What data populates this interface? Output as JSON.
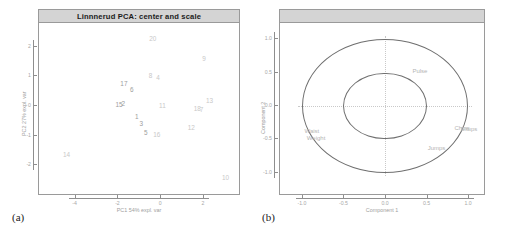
{
  "figure": {
    "panel_a_caption": "(a)",
    "panel_b_caption": "(b)"
  },
  "panel_a": {
    "title": "Linnnerud PCA: center and scale",
    "xlabel": "PC1 54% expl. var",
    "ylabel": "PC2 27% expl. var",
    "xticks": [
      "-4",
      "-2",
      "0",
      "2"
    ],
    "yticks": [
      "2",
      "1",
      "0",
      "-1",
      "-2"
    ]
  },
  "panel_b": {
    "xlabel": "Component 1",
    "ylabel": "Component 2",
    "xticks": [
      "-1.0",
      "-0.5",
      "0.0",
      "0.5",
      "1.0"
    ],
    "yticks": [
      "1.0",
      "0.5",
      "0.0",
      "-0.5",
      "-1.0"
    ]
  },
  "chart_data": [
    {
      "type": "scatter",
      "title": "Linnnerud PCA: center and scale",
      "xlabel": "PC1 54% expl. var",
      "ylabel": "PC2 27% expl. var",
      "xlim": [
        -5.2,
        3.4
      ],
      "ylim": [
        -2.6,
        2.6
      ],
      "grid": false,
      "point_labels_are_observation_ids": true,
      "points": [
        {
          "label": "20",
          "x": -0.35,
          "y": 2.3
        },
        {
          "label": "9",
          "x": 2.05,
          "y": 1.62
        },
        {
          "label": "8",
          "x": -0.45,
          "y": 1.06
        },
        {
          "label": "4",
          "x": -0.1,
          "y": 0.98
        },
        {
          "label": "17",
          "x": -1.7,
          "y": 0.78
        },
        {
          "label": "6",
          "x": -1.33,
          "y": 0.57
        },
        {
          "label": "13",
          "x": 2.3,
          "y": 0.19
        },
        {
          "label": "15",
          "x": -1.93,
          "y": 0.06
        },
        {
          "label": "2",
          "x": -1.73,
          "y": 0.11
        },
        {
          "label": "11",
          "x": 0.1,
          "y": 0.04
        },
        {
          "label": "18",
          "x": 1.73,
          "y": -0.05
        },
        {
          "label": "7",
          "x": 1.93,
          "y": -0.1
        },
        {
          "label": "1",
          "x": -1.1,
          "y": -0.35
        },
        {
          "label": "3",
          "x": -0.88,
          "y": -0.56
        },
        {
          "label": "12",
          "x": 1.45,
          "y": -0.7
        },
        {
          "label": "5",
          "x": -0.68,
          "y": -0.86
        },
        {
          "label": "16",
          "x": -0.16,
          "y": -0.95
        },
        {
          "label": "14",
          "x": -4.38,
          "y": -1.62
        },
        {
          "label": "10",
          "x": 3.05,
          "y": -2.4
        }
      ]
    },
    {
      "type": "scatter",
      "subtype": "correlation-circle",
      "xlabel": "Component 1",
      "ylabel": "Component 2",
      "xlim": [
        -1.12,
        1.12
      ],
      "ylim": [
        -1.12,
        1.12
      ],
      "grid": true,
      "circles": [
        {
          "radius": 1.0
        },
        {
          "radius": 0.5
        }
      ],
      "variables": [
        {
          "label": "Pulse",
          "x": 0.42,
          "y": 0.52
        },
        {
          "label": "Chins",
          "x": 0.93,
          "y": -0.33
        },
        {
          "label": "Situps",
          "x": 1.01,
          "y": -0.35
        },
        {
          "label": "Jumps",
          "x": 0.62,
          "y": -0.63
        },
        {
          "label": "Waist",
          "x": -0.88,
          "y": -0.38
        },
        {
          "label": "Weight",
          "x": -0.83,
          "y": -0.47
        }
      ]
    }
  ]
}
